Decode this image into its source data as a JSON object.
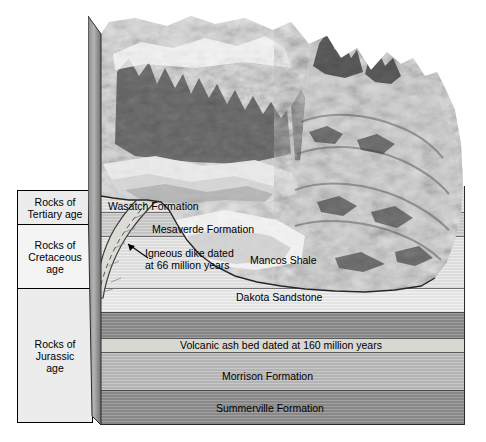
{
  "figure": {
    "type": "geologic-block-diagram"
  },
  "legend": {
    "title": "Rock age legend",
    "cells": [
      {
        "id": "tertiary",
        "label": "Rocks of\nTertiary age",
        "line1": "Rocks of",
        "line2": "Tertiary age",
        "line3": ""
      },
      {
        "id": "cretaceous",
        "label": "Rocks of Cretaceous age",
        "line1": "Rocks of",
        "line2": "Cretaceous",
        "line3": "age"
      },
      {
        "id": "jurassic",
        "label": "Rocks of Jurassic age",
        "line1": "Rocks of",
        "line2": "Jurassic",
        "line3": "age"
      }
    ]
  },
  "strata": {
    "layers": [
      {
        "id": "wasatch",
        "label": "Wasatch Formation",
        "age": "Tertiary",
        "color": "#e6e6e6"
      },
      {
        "id": "mesaverde",
        "label": "Mesaverde Formation",
        "age": "Cretaceous",
        "color": "#cfcfcf"
      },
      {
        "id": "mancos",
        "label": "Mancos Shale",
        "age": "Cretaceous",
        "color": "#e8e8e8"
      },
      {
        "id": "dakota",
        "label": "Dakota Sandstone",
        "age": "Cretaceous",
        "color": "#efefef"
      },
      {
        "id": "upper-jurassic",
        "label": "",
        "age": "Jurassic",
        "color": "#8d8d8d"
      },
      {
        "id": "ashbed",
        "label": "Volcanic ash bed dated at 160 million years",
        "age": "Jurassic",
        "color": "#d8d8d2"
      },
      {
        "id": "morrison",
        "label": "Morrison Formation",
        "age": "Jurassic",
        "color": "#bdbdbd"
      },
      {
        "id": "summerville",
        "label": "Summerville Formation",
        "age": "Jurassic",
        "color": "#8f8f8f"
      }
    ]
  },
  "annotations": {
    "dike": {
      "line1": "Igneous dike dated",
      "line2": "at 66 million years",
      "full": "Igneous dike dated at 66 million years",
      "age_value": "66",
      "age_unit": "million years"
    },
    "ash": {
      "full": "Volcanic ash bed dated at 160 million years",
      "age_value": "160",
      "age_unit": "million years"
    }
  },
  "colors": {
    "outline": "#2b2b2b",
    "legend_fill_a": "#ececec",
    "legend_fill_b": "#f4f4f4",
    "dike_fill": "#dcdcd6",
    "background": "#ffffff"
  }
}
